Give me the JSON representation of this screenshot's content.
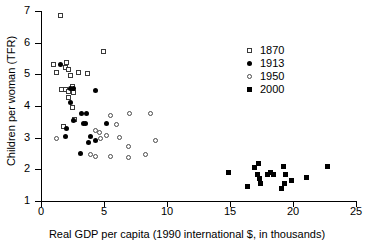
{
  "chart_data": {
    "type": "scatter",
    "title": "",
    "xlabel": "Real GDP per capita (1990 international $, in thousands)",
    "ylabel": "Children per woman (TFR)",
    "xlim": [
      0,
      25
    ],
    "ylim": [
      1,
      7
    ],
    "xticks": [
      0,
      5,
      10,
      15,
      20,
      25
    ],
    "yticks": [
      1,
      2,
      3,
      4,
      5,
      6,
      7
    ],
    "grid": false,
    "legend_position": "top-right",
    "series": [
      {
        "name": "1870",
        "marker": "open-square",
        "color": "#3a3a3a",
        "points": [
          [
            1.6,
            6.85
          ],
          [
            1.05,
            5.3
          ],
          [
            1.25,
            5.05
          ],
          [
            1.95,
            5.2
          ],
          [
            2.05,
            5.35
          ],
          [
            2.25,
            5.15
          ],
          [
            2.35,
            4.95
          ],
          [
            3.05,
            5.05
          ],
          [
            3.75,
            5.0
          ],
          [
            5.0,
            5.7
          ],
          [
            1.7,
            4.5
          ],
          [
            1.95,
            4.5
          ],
          [
            2.25,
            4.45
          ],
          [
            2.2,
            4.25
          ],
          [
            2.55,
            4.6
          ],
          [
            2.6,
            4.4
          ],
          [
            2.5,
            3.95
          ],
          [
            2.7,
            3.55
          ],
          [
            1.8,
            3.35
          ]
        ]
      },
      {
        "name": "1913",
        "marker": "filled-circle",
        "color": "#000000",
        "points": [
          [
            1.55,
            5.3
          ],
          [
            2.6,
            4.55
          ],
          [
            2.35,
            4.1
          ],
          [
            4.35,
            4.5
          ],
          [
            3.25,
            3.75
          ],
          [
            3.6,
            3.75
          ],
          [
            2.55,
            3.55
          ],
          [
            3.4,
            3.45
          ],
          [
            3.55,
            3.45
          ],
          [
            5.2,
            3.45
          ],
          [
            2.05,
            3.3
          ],
          [
            3.9,
            3.05
          ],
          [
            3.8,
            2.85
          ],
          [
            4.35,
            2.9
          ],
          [
            3.1,
            2.5
          ],
          [
            2.35,
            4.55
          ],
          [
            1.95,
            3.05
          ]
        ]
      },
      {
        "name": "1950",
        "marker": "open-circle",
        "color": "#4a4a4a",
        "points": [
          [
            1.3,
            2.95
          ],
          [
            5.55,
            3.7
          ],
          [
            7.05,
            3.75
          ],
          [
            6.05,
            3.4
          ],
          [
            8.7,
            3.75
          ],
          [
            4.35,
            3.2
          ],
          [
            4.7,
            3.15
          ],
          [
            5.2,
            3.05
          ],
          [
            6.3,
            3.0
          ],
          [
            7.0,
            2.7
          ],
          [
            4.0,
            2.45
          ],
          [
            4.4,
            2.4
          ],
          [
            5.55,
            2.4
          ],
          [
            7.0,
            2.35
          ],
          [
            9.1,
            2.9
          ],
          [
            8.3,
            2.45
          ],
          [
            4.75,
            2.95
          ]
        ]
      },
      {
        "name": "2000",
        "marker": "filled-square",
        "color": "#000000",
        "points": [
          [
            14.85,
            1.9
          ],
          [
            16.35,
            1.45
          ],
          [
            16.95,
            2.05
          ],
          [
            17.25,
            2.2
          ],
          [
            17.2,
            1.85
          ],
          [
            17.35,
            1.7
          ],
          [
            17.4,
            1.55
          ],
          [
            17.95,
            1.85
          ],
          [
            18.25,
            1.9
          ],
          [
            18.45,
            1.85
          ],
          [
            19.05,
            1.4
          ],
          [
            19.25,
            2.1
          ],
          [
            19.35,
            1.55
          ],
          [
            19.4,
            1.85
          ],
          [
            19.9,
            1.65
          ],
          [
            21.05,
            1.75
          ],
          [
            22.75,
            2.1
          ]
        ]
      }
    ]
  },
  "legend": {
    "entries": [
      {
        "label": "1870",
        "marker": "open-square"
      },
      {
        "label": "1913",
        "marker": "filled-circle"
      },
      {
        "label": "1950",
        "marker": "open-circle"
      },
      {
        "label": "2000",
        "marker": "filled-square"
      }
    ]
  }
}
